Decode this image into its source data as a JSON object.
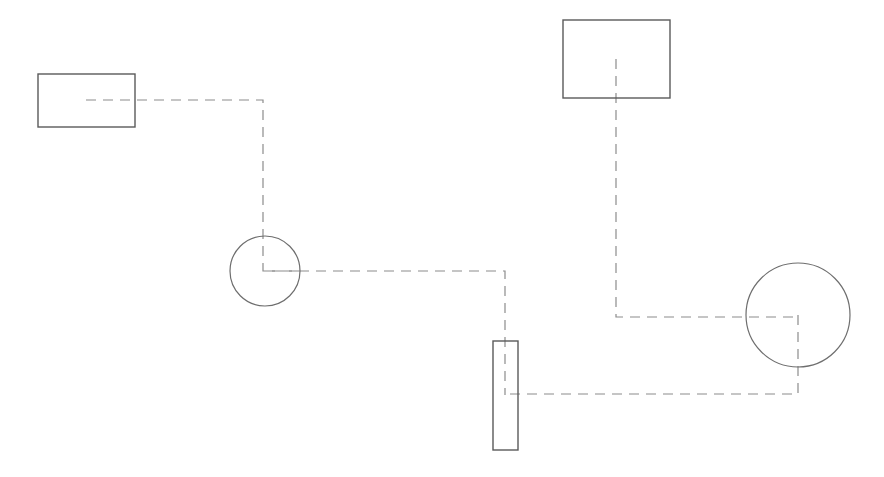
{
  "canvas": {
    "width": 884,
    "height": 477,
    "background_color": "#ffffff",
    "title": ""
  },
  "style": {
    "rect_stroke_color": "#5a5a5a",
    "rect_stroke_width": 1.4,
    "circle_stroke_color": "#6e6e6e",
    "circle_stroke_width": 1.2,
    "connector_stroke_color": "#8c8c8c",
    "connector_stroke_width": 1.2,
    "connector_dash_pattern": "10 7"
  },
  "nodes": [
    {
      "id": "rect-top-left",
      "shape": "rectangle",
      "label": "",
      "x": 38,
      "y": 74,
      "width": 97,
      "height": 53,
      "center_x": 86,
      "center_y": 100
    },
    {
      "id": "rect-top-right",
      "shape": "rectangle",
      "label": "",
      "x": 563,
      "y": 20,
      "width": 107,
      "height": 78,
      "center_x": 616,
      "center_y": 59
    },
    {
      "id": "rect-bottom-narrow",
      "shape": "rectangle",
      "label": "",
      "x": 493,
      "y": 341,
      "width": 25,
      "height": 109,
      "center_x": 505,
      "center_y": 395
    },
    {
      "id": "circle-left",
      "shape": "circle",
      "label": "",
      "center_x": 265,
      "center_y": 271,
      "radius": 35
    },
    {
      "id": "circle-right",
      "shape": "circle",
      "label": "",
      "center_x": 798,
      "center_y": 315,
      "radius": 52
    }
  ],
  "connectors": [
    {
      "id": "connector-rect-top-left-to-circle-left",
      "from": "rect-top-left",
      "to": "circle-left",
      "style": "dashed",
      "points": "86,100 263,100 263,271 300,271"
    },
    {
      "id": "connector-circle-left-to-rect-bottom-narrow",
      "from": "circle-left",
      "to": "rect-bottom-narrow",
      "style": "dashed",
      "points": "265,271 505,271 505,395"
    },
    {
      "id": "connector-rect-top-right-to-circle-right",
      "from": "rect-top-right",
      "to": "circle-right",
      "style": "dashed",
      "points": "616,59 616,317 798,317"
    },
    {
      "id": "connector-circle-right-to-rect-bottom-narrow",
      "from": "circle-right",
      "to": "rect-bottom-narrow",
      "style": "dashed",
      "points": "798,315 798,394 505,394"
    }
  ]
}
